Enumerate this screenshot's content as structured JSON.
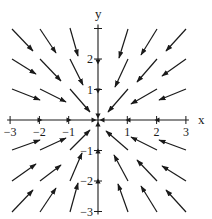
{
  "figure": {
    "type": "vector_field",
    "axis_labels": {
      "x": "x",
      "y": "y"
    },
    "x_ticks": [
      {
        "value": -3,
        "label": "−3"
      },
      {
        "value": -2,
        "label": "−2"
      },
      {
        "value": -1,
        "label": "−1"
      },
      {
        "value": 1,
        "label": "1"
      },
      {
        "value": 2,
        "label": "2"
      },
      {
        "value": 3,
        "label": "3"
      }
    ],
    "y_ticks": [
      {
        "value": 3,
        "label": ""
      },
      {
        "value": 2,
        "label": "2"
      },
      {
        "value": 1,
        "label": "1"
      },
      {
        "value": -1,
        "label": "−1"
      },
      {
        "value": -2,
        "label": "−2"
      },
      {
        "value": -3,
        "label": "−3"
      }
    ],
    "range": {
      "x": [
        -3,
        3
      ],
      "y": [
        -3,
        3
      ]
    },
    "stroke_color": "#1a1a1a",
    "pixel_geometry": {
      "origin_x": 98,
      "origin_y": 120,
      "unit_x": 29.3,
      "unit_y": 30.5
    },
    "arrows_px": [
      [
        12,
        29,
        33,
        51
      ],
      [
        40,
        29,
        56,
        53
      ],
      [
        70,
        28,
        78,
        56
      ],
      [
        12,
        59,
        36,
        74
      ],
      [
        40,
        59,
        61,
        81
      ],
      [
        70,
        59,
        83,
        85
      ],
      [
        12,
        89,
        40,
        100
      ],
      [
        40,
        89,
        66,
        102
      ],
      [
        70,
        89,
        90,
        112
      ],
      [
        128,
        29,
        119,
        58
      ],
      [
        157,
        29,
        141,
        55
      ],
      [
        186,
        29,
        166,
        51
      ],
      [
        128,
        59,
        115,
        87
      ],
      [
        157,
        59,
        137,
        82
      ],
      [
        186,
        59,
        162,
        76
      ],
      [
        128,
        89,
        108,
        112
      ],
      [
        157,
        89,
        131,
        104
      ],
      [
        186,
        89,
        159,
        100
      ],
      [
        12,
        150,
        40,
        140
      ],
      [
        40,
        150,
        66,
        138
      ],
      [
        70,
        150,
        90,
        130
      ],
      [
        12,
        181,
        36,
        164
      ],
      [
        40,
        181,
        61,
        165
      ],
      [
        70,
        181,
        82,
        153
      ],
      [
        12,
        212,
        33,
        190
      ],
      [
        40,
        212,
        56,
        188
      ],
      [
        70,
        212,
        78,
        183
      ],
      [
        128,
        150,
        106,
        131
      ],
      [
        157,
        150,
        131,
        137
      ],
      [
        186,
        150,
        159,
        140
      ],
      [
        128,
        181,
        114,
        155
      ],
      [
        157,
        181,
        137,
        160
      ],
      [
        186,
        181,
        162,
        166
      ],
      [
        128,
        212,
        118,
        184
      ],
      [
        157,
        212,
        141,
        186
      ],
      [
        186,
        212,
        166,
        190
      ]
    ],
    "axis_arrowheads_px": [
      {
        "x": 40,
        "y": 120,
        "dir": "right"
      },
      {
        "x": 69,
        "y": 120,
        "dir": "right"
      },
      {
        "x": 94,
        "y": 120,
        "dir": "right"
      },
      {
        "x": 102,
        "y": 120,
        "dir": "left"
      },
      {
        "x": 128,
        "y": 120,
        "dir": "left"
      },
      {
        "x": 157,
        "y": 120,
        "dir": "left"
      },
      {
        "x": 98,
        "y": 62,
        "dir": "down"
      },
      {
        "x": 98,
        "y": 91,
        "dir": "down"
      },
      {
        "x": 98,
        "y": 116,
        "dir": "down"
      },
      {
        "x": 98,
        "y": 124,
        "dir": "up"
      },
      {
        "x": 98,
        "y": 151,
        "dir": "up"
      },
      {
        "x": 98,
        "y": 181,
        "dir": "up"
      }
    ]
  }
}
